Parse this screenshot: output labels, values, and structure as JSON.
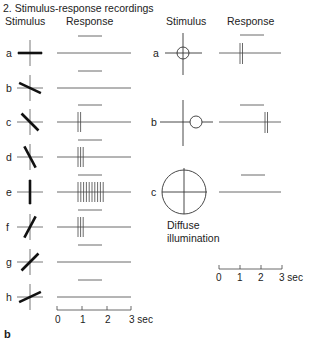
{
  "title": "2. Stimulus-response recordings",
  "panel_label": "b",
  "left": {
    "header_stimulus": "Stimulus",
    "header_response": "Response",
    "rows": [
      {
        "label": "a",
        "angle": 0,
        "spikes": 0
      },
      {
        "label": "b",
        "angle": 25,
        "spikes": 0
      },
      {
        "label": "c",
        "angle": 45,
        "spikes": 2
      },
      {
        "label": "d",
        "angle": 62,
        "spikes": 3
      },
      {
        "label": "e",
        "angle": 90,
        "spikes": 10
      },
      {
        "label": "f",
        "angle": 118,
        "spikes": 3
      },
      {
        "label": "g",
        "angle": 135,
        "spikes": 0
      },
      {
        "label": "h",
        "angle": 155,
        "spikes": 0
      }
    ],
    "axis": {
      "ticks": [
        "0",
        "1",
        "2",
        "3 sec"
      ]
    }
  },
  "right": {
    "header_stimulus": "Stimulus",
    "header_response": "Response",
    "rows": [
      {
        "label": "a",
        "stimulus": "small centered spot",
        "response": "on-burst"
      },
      {
        "label": "b",
        "stimulus": "small off-center spot",
        "response": "off-burst"
      },
      {
        "label": "c",
        "stimulus": "large spot",
        "response": "none"
      }
    ],
    "diffuse_line1": "Diffuse",
    "diffuse_line2": "illumination",
    "axis": {
      "ticks": [
        "0",
        "1",
        "2",
        "3 sec"
      ]
    }
  }
}
